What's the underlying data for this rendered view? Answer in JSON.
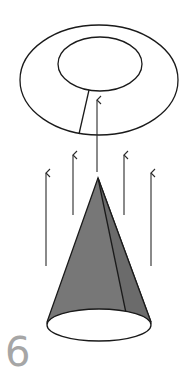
{
  "figure": {
    "number_label": "6",
    "colors": {
      "stroke": "#1a1a1a",
      "cone_fill": "#7a7a7a",
      "cone_fill_dark": "#6b6b6b",
      "label": "#a6a6a6",
      "background": "#ffffff"
    },
    "elements": {
      "ring_outer": {
        "cx": 99,
        "cy": 80,
        "rx": 79,
        "ry": 55
      },
      "ring_inner": {
        "cx": 100,
        "cy": 64,
        "rx": 42,
        "ry": 27
      },
      "ring_cut": {
        "x1": 89,
        "y1": 90,
        "x2": 79,
        "y2": 134
      },
      "cone_apex": {
        "x": 98,
        "y": 178
      },
      "cone_base": {
        "cx": 99,
        "cy": 325,
        "rx": 52,
        "ry": 16
      },
      "arrows": [
        {
          "x": 46,
          "y_head": 173,
          "y_tail": 266
        },
        {
          "x": 73,
          "y_head": 155,
          "y_tail": 215
        },
        {
          "x": 97,
          "y_head": 100,
          "y_tail": 172
        },
        {
          "x": 124,
          "y_head": 155,
          "y_tail": 215
        },
        {
          "x": 151,
          "y_head": 173,
          "y_tail": 266
        }
      ]
    }
  }
}
